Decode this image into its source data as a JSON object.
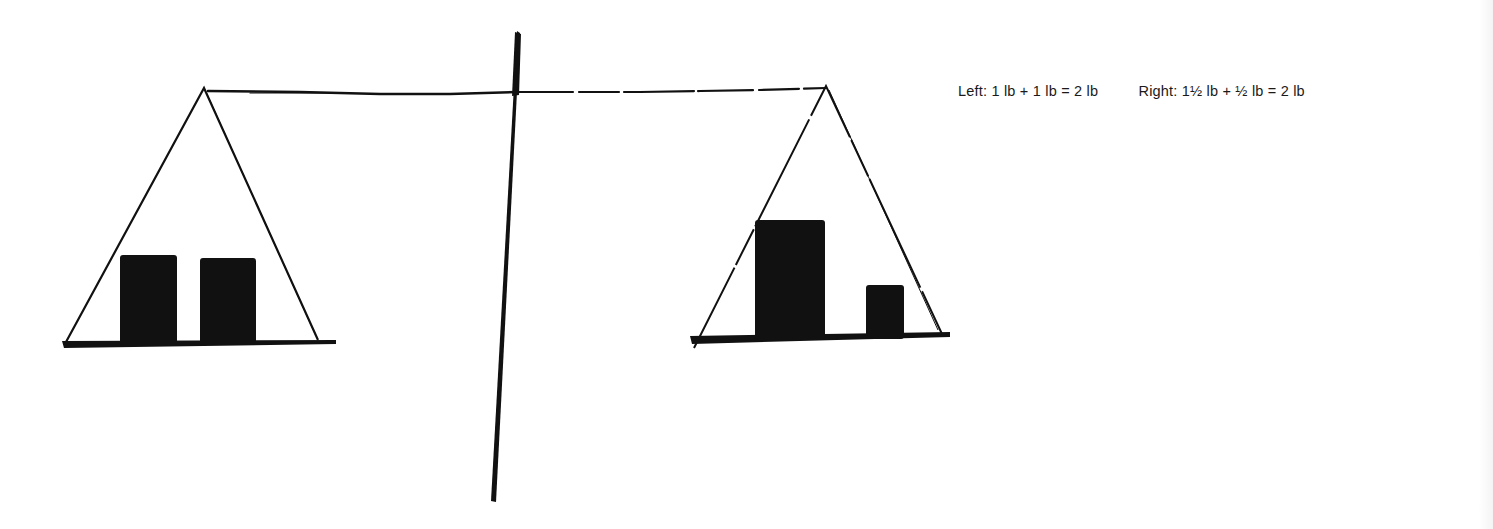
{
  "diagram": {
    "style": "hand-drawn ink sketch",
    "ink_color": "#111111",
    "background_color": "#ffffff",
    "left_pan": {
      "weights": [
        {
          "label": "1 lb",
          "size": "medium"
        },
        {
          "label": "1 lb",
          "size": "medium"
        }
      ],
      "total": "2 lb"
    },
    "right_pan": {
      "weights": [
        {
          "label": "1½ lb",
          "size": "large"
        },
        {
          "label": "½ lb",
          "size": "small"
        }
      ],
      "total": "2 lb"
    },
    "state": "balanced"
  },
  "caption": {
    "left": "Left: 1 lb + 1 lb = 2 lb",
    "right": "Right: 1½ lb + ½ lb = 2 lb"
  }
}
